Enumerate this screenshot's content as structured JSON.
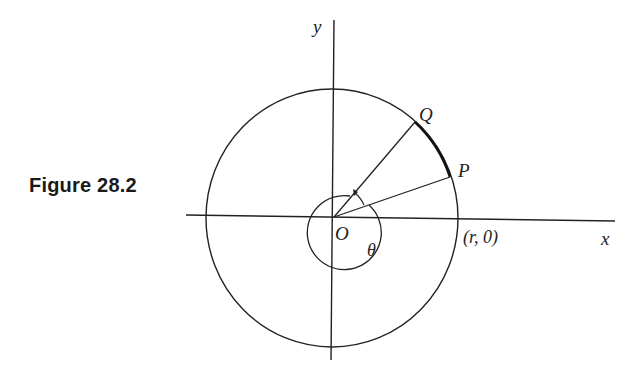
{
  "figure": {
    "caption": "Figure 28.2"
  },
  "labels": {
    "y_axis": "y",
    "x_axis": "x",
    "origin": "O",
    "point_q": "Q",
    "point_p": "P",
    "angle": "θ",
    "point_r0": "(r, 0)"
  },
  "colors": {
    "stroke": "#222222",
    "background": "#ffffff"
  }
}
